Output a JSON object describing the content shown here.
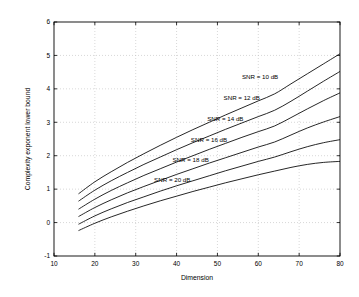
{
  "chart_data": {
    "type": "line",
    "title": "",
    "xlabel": "Dimension",
    "ylabel": "Complexity exponent lower bound",
    "xlim": [
      10,
      80
    ],
    "ylim": [
      -1,
      6
    ],
    "xticks": [
      10,
      20,
      30,
      40,
      50,
      60,
      70,
      80
    ],
    "yticks": [
      -1,
      0,
      1,
      2,
      3,
      4,
      5,
      6
    ],
    "grid": true,
    "legend_position": "inline-annotations",
    "x": [
      16,
      20,
      24,
      28,
      32,
      36,
      40,
      44,
      48,
      52,
      56,
      60,
      64,
      68,
      72,
      76,
      80
    ],
    "series": [
      {
        "name": "SNR = 10 dB",
        "label": "SNR = 10 dB",
        "values": [
          0.86,
          1.22,
          1.52,
          1.8,
          2.06,
          2.31,
          2.55,
          2.78,
          3.0,
          3.22,
          3.43,
          3.64,
          3.85,
          4.15,
          4.45,
          4.75,
          5.05
        ]
      },
      {
        "name": "SNR = 12 dB",
        "label": "SNR = 12 dB",
        "values": [
          0.64,
          0.97,
          1.25,
          1.5,
          1.74,
          1.96,
          2.18,
          2.39,
          2.59,
          2.79,
          2.98,
          3.17,
          3.36,
          3.63,
          3.93,
          4.23,
          4.52
        ]
      },
      {
        "name": "SNR = 14 dB",
        "label": "SNR = 14 dB",
        "values": [
          0.4,
          0.7,
          0.96,
          1.19,
          1.41,
          1.61,
          1.81,
          2.0,
          2.19,
          2.37,
          2.55,
          2.72,
          2.89,
          3.14,
          3.4,
          3.65,
          3.88
        ]
      },
      {
        "name": "SNR = 16 dB",
        "label": "SNR = 16 dB",
        "values": [
          0.18,
          0.45,
          0.68,
          0.89,
          1.08,
          1.26,
          1.44,
          1.61,
          1.78,
          1.94,
          2.1,
          2.26,
          2.41,
          2.62,
          2.83,
          3.01,
          3.17
        ]
      },
      {
        "name": "SNR = 18 dB",
        "label": "SNR = 18 dB",
        "values": [
          -0.05,
          0.2,
          0.41,
          0.6,
          0.77,
          0.94,
          1.1,
          1.25,
          1.4,
          1.55,
          1.69,
          1.83,
          1.96,
          2.12,
          2.27,
          2.39,
          2.48
        ]
      },
      {
        "name": "SNR = 20 dB",
        "label": "SNR = 20 dB",
        "values": [
          -0.24,
          -0.02,
          0.17,
          0.34,
          0.5,
          0.65,
          0.79,
          0.93,
          1.06,
          1.19,
          1.31,
          1.43,
          1.54,
          1.65,
          1.74,
          1.8,
          1.83
        ]
      }
    ],
    "annotations": [
      {
        "text": "SNR = 10 dB",
        "x": 56.0,
        "y": 4.3
      },
      {
        "text": "SNR = 12 dB",
        "x": 51.5,
        "y": 3.67
      },
      {
        "text": "SNR = 14 dB",
        "x": 47.5,
        "y": 3.03
      },
      {
        "text": "SNR = 16 dB",
        "x": 43.5,
        "y": 2.4
      },
      {
        "text": "SNR = 18 dB",
        "x": 39.0,
        "y": 1.8
      },
      {
        "text": "SNR = 20 dB",
        "x": 34.5,
        "y": 1.2
      }
    ],
    "colors": {
      "line": "#000000",
      "grid": "#bdbdbd",
      "axis": "#000000",
      "background": "#ffffff"
    }
  }
}
